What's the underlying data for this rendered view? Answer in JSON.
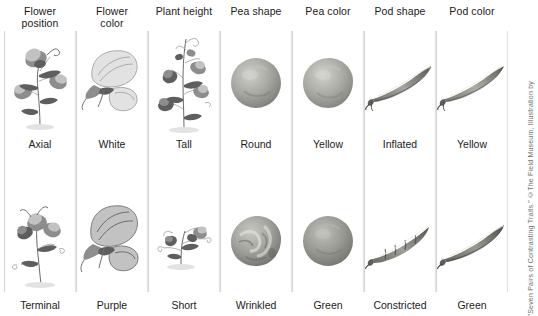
{
  "figure": {
    "title_alt": "Seven Pairs of Contrasting Traits",
    "credit": "\"Seven Pairs of Contrasting Traits.\" ©The Field Museum, Illustration by",
    "background": "#ffffff",
    "text_color": "#1b1b1b",
    "divider_color": "#d6d6d6"
  },
  "traits": [
    {
      "header_line1": "Flower",
      "header_line2": "position",
      "dominant": "Axial",
      "recessive": "Terminal",
      "icon_top": "pea-plant-axial-flowers-icon",
      "icon_bottom": "pea-plant-terminal-flowers-icon"
    },
    {
      "header_line1": "Flower",
      "header_line2": "color",
      "dominant": "White",
      "recessive": "Purple",
      "icon_top": "pea-flower-white-icon",
      "icon_bottom": "pea-flower-purple-icon"
    },
    {
      "header_line1": "Plant height",
      "header_line2": "",
      "dominant": "Tall",
      "recessive": "Short",
      "icon_top": "pea-plant-tall-icon",
      "icon_bottom": "pea-plant-short-icon"
    },
    {
      "header_line1": "Pea shape",
      "header_line2": "",
      "dominant": "Round",
      "recessive": "Wrinkled",
      "icon_top": "pea-seed-round-icon",
      "icon_bottom": "pea-seed-wrinkled-icon"
    },
    {
      "header_line1": "Pea color",
      "header_line2": "",
      "dominant": "Yellow",
      "recessive": "Green",
      "icon_top": "pea-seed-yellow-icon",
      "icon_bottom": "pea-seed-green-icon"
    },
    {
      "header_line1": "Pod shape",
      "header_line2": "",
      "dominant": "Inflated",
      "recessive": "Constricted",
      "icon_top": "pea-pod-inflated-icon",
      "icon_bottom": "pea-pod-constricted-icon"
    },
    {
      "header_line1": "Pod color",
      "header_line2": "",
      "dominant": "Yellow",
      "recessive": "Green",
      "icon_top": "pea-pod-yellow-icon",
      "icon_bottom": "pea-pod-green-icon"
    }
  ]
}
